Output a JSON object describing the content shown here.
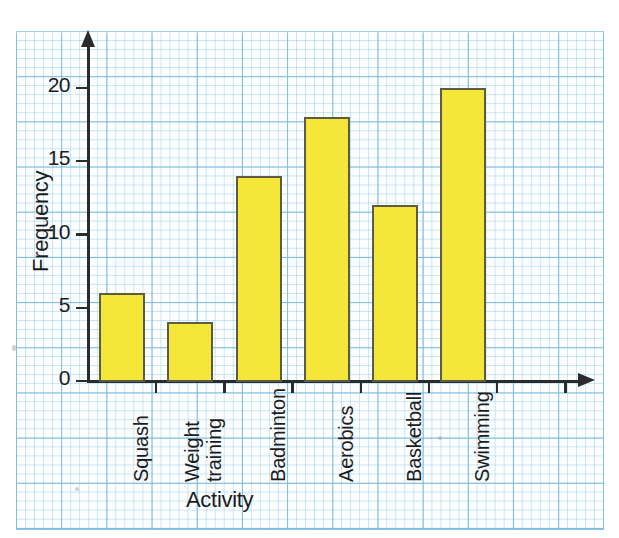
{
  "chart_data": {
    "type": "bar",
    "title": "",
    "xlabel": "Activity",
    "ylabel": "Frequency",
    "categories": [
      "Squash",
      "Weight training",
      "Badminton",
      "Aerobics",
      "Basketball",
      "Swimming"
    ],
    "values": [
      6,
      4,
      14,
      18,
      12,
      20
    ],
    "yticks": [
      "0",
      "5",
      "10",
      "15",
      "20"
    ],
    "ytick_values": [
      0,
      5,
      10,
      15,
      20
    ],
    "ylim": [
      0,
      23
    ],
    "grid": true,
    "legend": "none",
    "bar_color": "#f5e63a",
    "bar_border_color": "#5d5b43",
    "grid_minor_color": "#96cdeb",
    "grid_major_color": "#78b9dc",
    "axis_color": "#2b2b2b",
    "background": "#fdfeff"
  },
  "category_labels": {
    "squash": "Squash",
    "weight_training_line1": "Weight",
    "weight_training_line2": "training",
    "badminton": "Badminton",
    "aerobics": "Aerobics",
    "basketball": "Basketball",
    "swimming": "Swimming"
  }
}
